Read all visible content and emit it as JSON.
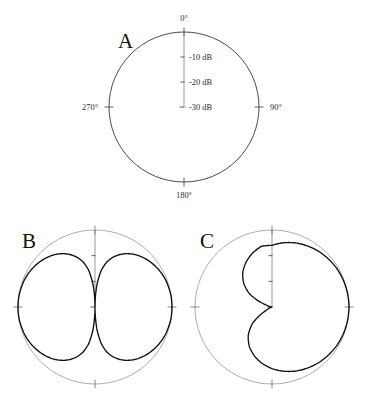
{
  "figure": {
    "background_color": "#ffffff",
    "curve_color": "#111111",
    "grid_color": "#2a2a2a",
    "light_grid_color": "#8a8a8a",
    "width": 367,
    "height": 399
  },
  "panels": [
    {
      "letter": "A",
      "letter_x": 118,
      "letter_y": 48,
      "center_x": 184,
      "center_y": 107,
      "radius": 75,
      "outer_style": "dark",
      "show_angle_labels": true,
      "show_db_labels": true,
      "show_center_mark": true,
      "pattern": "none"
    },
    {
      "letter": "B",
      "letter_x": 22,
      "letter_y": 248,
      "center_x": 95,
      "center_y": 307,
      "radius": 77,
      "outer_style": "light",
      "show_angle_labels": false,
      "show_db_labels": false,
      "show_center_mark": false,
      "pattern": "bidirectional"
    },
    {
      "letter": "C",
      "letter_x": 200,
      "letter_y": 248,
      "center_x": 272,
      "center_y": 307,
      "radius": 77,
      "outer_style": "light",
      "show_angle_labels": false,
      "show_db_labels": false,
      "show_center_mark": false,
      "pattern": "cardioid"
    }
  ],
  "angle_labels": [
    {
      "text": "0°",
      "angle_deg": 0
    },
    {
      "text": "90°",
      "angle_deg": 90
    },
    {
      "text": "180°",
      "angle_deg": 180
    },
    {
      "text": "270°",
      "angle_deg": 270
    }
  ],
  "db_labels": [
    {
      "text": "-10 dB",
      "db": -10
    },
    {
      "text": "-20 dB",
      "db": -20
    },
    {
      "text": "-30 dB",
      "db": -30
    }
  ],
  "chart_data": {
    "type": "line",
    "subtype": "polar-radiation-pattern",
    "title": "",
    "xlabel": "",
    "ylabel": "",
    "panel_count": 3,
    "angle_unit": "degrees",
    "angle_zero_location": "top",
    "angle_direction": "clockwise",
    "radial_unit": "dB",
    "radial_range_db": [
      -30,
      0
    ],
    "radial_tick_db": [
      -10,
      -20,
      -30
    ],
    "radial_tick_labels": [
      "-10 dB",
      "-20 dB",
      "-30 dB"
    ],
    "angle_tick_deg": [
      0,
      90,
      180,
      270
    ],
    "angle_tick_labels": [
      "0°",
      "90°",
      "180°",
      "270°"
    ],
    "grid": false,
    "legend": false,
    "panels": [
      {
        "label": "A",
        "description": "Empty polar plot template showing dB scale and angular axes; no radiation pattern plotted.",
        "series": []
      },
      {
        "label": "B",
        "description": "Bidirectional figure-eight pattern with deep null at 0 degrees and maxima at 90 and 270 degrees.",
        "series": [
          {
            "name": "bidirectional",
            "formula_db": "20*log10(|sin(theta)|)",
            "angles_deg": [
              0,
              5,
              10,
              15,
              20,
              25,
              30,
              35,
              40,
              45,
              50,
              55,
              60,
              65,
              70,
              75,
              80,
              85,
              90,
              95,
              100,
              105,
              110,
              115,
              120,
              125,
              130,
              135,
              140,
              145,
              150,
              155,
              160,
              165,
              170,
              175,
              180,
              185,
              190,
              195,
              200,
              205,
              210,
              215,
              220,
              225,
              230,
              235,
              240,
              245,
              250,
              255,
              260,
              265,
              270,
              275,
              280,
              285,
              290,
              295,
              300,
              305,
              310,
              315,
              320,
              325,
              330,
              335,
              340,
              345,
              350,
              355,
              360
            ],
            "values_db": [
              -30,
              -21.2,
              -15.2,
              -11.7,
              -9.3,
              -7.5,
              -6.0,
              -4.8,
              -3.8,
              -3.0,
              -2.3,
              -1.7,
              -1.2,
              -0.8,
              -0.5,
              -0.3,
              -0.1,
              -0.03,
              0,
              -0.03,
              -0.1,
              -0.3,
              -0.5,
              -0.8,
              -1.2,
              -1.7,
              -2.3,
              -3.0,
              -3.8,
              -4.8,
              -6.0,
              -7.5,
              -9.3,
              -11.7,
              -15.2,
              -21.2,
              -30,
              -21.2,
              -15.2,
              -11.7,
              -9.3,
              -7.5,
              -6.0,
              -4.8,
              -3.8,
              -3.0,
              -2.3,
              -1.7,
              -1.2,
              -0.8,
              -0.5,
              -0.3,
              -0.1,
              -0.03,
              0,
              -0.03,
              -0.1,
              -0.3,
              -0.5,
              -0.8,
              -1.2,
              -1.7,
              -2.3,
              -3.0,
              -3.8,
              -4.8,
              -6.0,
              -7.5,
              -9.3,
              -11.7,
              -15.2,
              -21.2,
              -30
            ]
          }
        ]
      },
      {
        "label": "C",
        "description": "Cardioid pattern with null at 270 degrees and maximum at 90 degrees.",
        "series": [
          {
            "name": "cardioid",
            "formula_db": "20*log10((1+sin(theta))/2)",
            "angles_deg": [
              0,
              10,
              20,
              30,
              40,
              50,
              60,
              70,
              80,
              90,
              100,
              110,
              120,
              130,
              140,
              150,
              160,
              170,
              180,
              190,
              200,
              210,
              220,
              230,
              240,
              250,
              260,
              265,
              270,
              275,
              280,
              290,
              300,
              310,
              320,
              330,
              340,
              350,
              360
            ],
            "values_db": [
              -6.0,
              -4.6,
              -3.4,
              -2.5,
              -1.7,
              -1.1,
              -0.6,
              -0.3,
              -0.1,
              0,
              -0.1,
              -0.3,
              -0.6,
              -1.1,
              -1.7,
              -2.5,
              -3.4,
              -4.6,
              -6.0,
              -7.7,
              -9.8,
              -12.3,
              -15.6,
              -20.1,
              -27.2,
              -30,
              -30,
              -30,
              -30,
              -30,
              -30,
              -27.2,
              -20.1,
              -15.6,
              -12.3,
              -9.8,
              -7.7,
              -6.0,
              -6.0
            ]
          }
        ]
      }
    ]
  }
}
